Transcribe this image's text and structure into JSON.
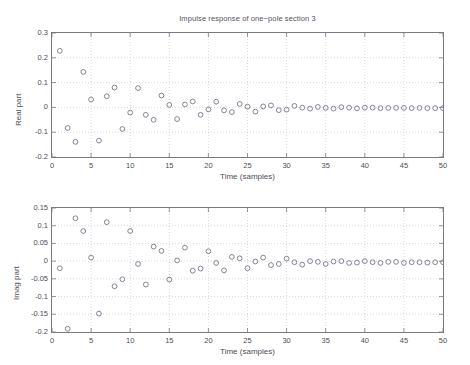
{
  "figure": {
    "title": "Impulse response of one−pole section 3",
    "background": "#ffffff",
    "marker_color": "#6b7183",
    "grid_color": "#bdbdc6",
    "axis_color": "#7a7a84"
  },
  "chart_data": [
    {
      "type": "scatter",
      "id": "real-part",
      "title": "Impulse response of one−pole section 3",
      "xlabel": "Time (samples)",
      "ylabel": "Real part",
      "xlim": [
        0,
        50
      ],
      "ylim": [
        -0.2,
        0.3
      ],
      "xticks": [
        0,
        5,
        10,
        15,
        20,
        25,
        30,
        35,
        40,
        45,
        50
      ],
      "xticklabels": [
        "0",
        "5",
        "10",
        "15",
        "20",
        "25",
        "30",
        "35",
        "40",
        "45",
        "50"
      ],
      "yticks": [
        -0.2,
        -0.1,
        0,
        0.1,
        0.2,
        0.3
      ],
      "yticklabels": [
        "-0.2",
        "-0.1",
        "0",
        "0.1",
        "0.2",
        "0.3"
      ],
      "grid": true,
      "legend": null,
      "marker": "circle-open",
      "x": [
        1,
        2,
        3,
        4,
        5,
        6,
        7,
        8,
        9,
        10,
        11,
        12,
        13,
        14,
        15,
        16,
        17,
        18,
        19,
        20,
        21,
        22,
        23,
        24,
        25,
        26,
        27,
        28,
        29,
        30,
        31,
        32,
        33,
        34,
        35,
        36,
        37,
        38,
        39,
        40,
        41,
        42,
        43,
        44,
        45,
        46,
        47,
        48,
        49,
        50
      ],
      "y": [
        0.228,
        -0.083,
        -0.139,
        0.143,
        0.032,
        -0.134,
        0.045,
        0.08,
        -0.087,
        -0.021,
        0.078,
        -0.03,
        -0.05,
        0.048,
        0.01,
        -0.047,
        0.012,
        0.024,
        -0.03,
        -0.008,
        0.023,
        -0.012,
        -0.019,
        0.014,
        0.003,
        -0.017,
        0.004,
        0.008,
        -0.011,
        -0.009,
        0.006,
        -0.001,
        -0.005,
        0.002,
        -0.002,
        -0.005,
        0.001,
        -0.001,
        -0.004,
        -0.001,
        -0.001,
        -0.003,
        -0.002,
        -0.002,
        -0.002,
        -0.003,
        -0.002,
        -0.003,
        -0.003,
        -0.003
      ]
    },
    {
      "type": "scatter",
      "id": "imag-part",
      "title": "",
      "xlabel": "Time (samples)",
      "ylabel": "Imag part",
      "xlim": [
        0,
        50
      ],
      "ylim": [
        -0.2,
        0.15
      ],
      "xticks": [
        0,
        5,
        10,
        15,
        20,
        25,
        30,
        35,
        40,
        45,
        50
      ],
      "xticklabels": [
        "0",
        "5",
        "10",
        "15",
        "20",
        "25",
        "30",
        "35",
        "40",
        "45",
        "50"
      ],
      "yticks": [
        -0.2,
        -0.15,
        -0.1,
        -0.05,
        0,
        0.05,
        0.1,
        0.15
      ],
      "yticklabels": [
        "-0.2",
        "-0.15",
        "-0.1",
        "-0.05",
        "0",
        "0.05",
        "0.1",
        "0.15"
      ],
      "grid": true,
      "legend": null,
      "marker": "circle-open",
      "x": [
        1,
        2,
        3,
        4,
        5,
        6,
        7,
        8,
        9,
        10,
        11,
        12,
        13,
        14,
        15,
        16,
        17,
        18,
        19,
        20,
        21,
        22,
        23,
        24,
        25,
        26,
        27,
        28,
        29,
        30,
        31,
        32,
        33,
        34,
        35,
        36,
        37,
        38,
        39,
        40,
        41,
        42,
        43,
        44,
        45,
        46,
        47,
        48,
        49,
        50
      ],
      "y": [
        -0.02,
        -0.191,
        0.121,
        0.085,
        0.01,
        -0.148,
        0.11,
        -0.071,
        -0.051,
        0.085,
        -0.008,
        -0.066,
        0.041,
        0.029,
        -0.052,
        0.002,
        0.038,
        -0.027,
        -0.021,
        0.028,
        -0.005,
        -0.026,
        0.012,
        0.008,
        -0.02,
        -0.001,
        0.01,
        -0.011,
        -0.008,
        0.007,
        -0.003,
        -0.01,
        0.0,
        -0.002,
        -0.008,
        -0.001,
        0.0,
        -0.005,
        -0.004,
        0.0,
        -0.003,
        -0.005,
        -0.002,
        -0.002,
        -0.005,
        -0.003,
        -0.003,
        -0.004,
        -0.003,
        -0.003
      ]
    }
  ]
}
